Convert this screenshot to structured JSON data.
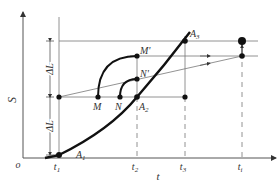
{
  "diagram": {
    "type": "kinematic-displacement-time-diagram",
    "axes": {
      "y_label": "S",
      "x_label": "t",
      "origin_label": "o"
    },
    "x_ticks": [
      {
        "label": "t",
        "sub": "1"
      },
      {
        "label": "t",
        "sub": "2"
      },
      {
        "label": "t",
        "sub": "3"
      },
      {
        "label": "t",
        "sub": "i"
      }
    ],
    "points": [
      {
        "label": "A",
        "sub": "1"
      },
      {
        "label": "A",
        "sub": "2"
      },
      {
        "label": "A",
        "sub": "3"
      },
      {
        "label": "M",
        "sub": ""
      },
      {
        "label": "N",
        "sub": ""
      },
      {
        "label": "M'",
        "sub": ""
      },
      {
        "label": "N'",
        "sub": ""
      }
    ],
    "dimensions": [
      {
        "label": "ΔL",
        "position": "upper"
      },
      {
        "label": "ΔL",
        "position": "lower"
      }
    ],
    "colors": {
      "axis": "#555555",
      "curve": "#111111",
      "thin_line": "#666666",
      "background": "#ffffff"
    }
  }
}
